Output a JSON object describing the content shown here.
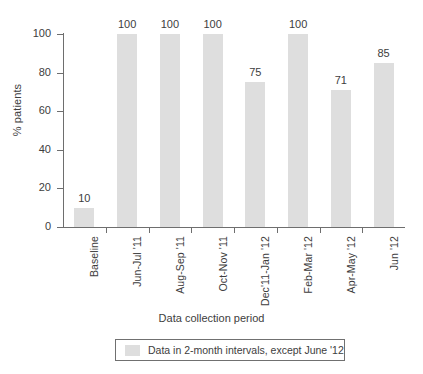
{
  "chart_data": {
    "type": "bar",
    "title": "",
    "subtitle": "",
    "xlabel": "Data collection period",
    "ylabel": "% patients",
    "ylim": [
      0,
      100
    ],
    "yticks": [
      0,
      20,
      40,
      60,
      80,
      100
    ],
    "ytick_labels": [
      "0",
      "20",
      "40",
      "60",
      "80",
      "100"
    ],
    "grid": false,
    "legend_position": "bottom",
    "bar_color": "#dedede",
    "axis_color": "#6e6e6e",
    "text_color": "#3d3d3d",
    "categories": [
      "Baseline",
      "Jun-Jul '11",
      "Aug-Sep '11",
      "Oct-Nov '11",
      "Dec'11-Jan '12",
      "Feb-Mar '12",
      "Apr-May '12",
      "Jun '12"
    ],
    "values": [
      10,
      100,
      100,
      100,
      75,
      100,
      71,
      85
    ],
    "data_labels": [
      "10",
      "100",
      "100",
      "100",
      "75",
      "100",
      "71",
      "85"
    ],
    "legend": [
      {
        "label": "Data in 2-month intervals, except June '12",
        "color": "#dedede"
      }
    ]
  }
}
